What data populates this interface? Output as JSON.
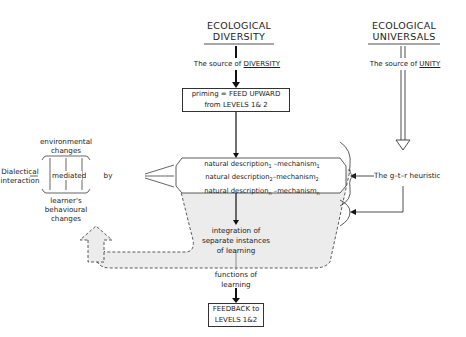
{
  "title_left": {
    "line1": "ECOLOGICAL",
    "line2": "DIVERSITY"
  },
  "title_right": {
    "line1": "ECOLOGICAL",
    "line2": "UNIVERSALS"
  },
  "source_diversity": {
    "prefix": "The source of ",
    "emph": "DIVERSITY"
  },
  "source_unity": {
    "prefix": "The source of ",
    "emph": "UNITY"
  },
  "priming_box": {
    "line1": "priming = FEED UPWARD",
    "line2": "from LEVELS 1& 2"
  },
  "descriptions": [
    {
      "text": "natural description",
      "sub1": "1",
      "mid": " –mechanism",
      "sub2": "1"
    },
    {
      "text": "natural description",
      "sub1": "2",
      "mid": "–mechanism",
      "sub2": "2"
    },
    {
      "text": "natural description",
      "sub1": "n",
      "mid": " –mechanism",
      "sub2": "n"
    }
  ],
  "dialectical": {
    "line1": "Dialectical",
    "line2": "interaction"
  },
  "env_changes": {
    "line1": "environmental",
    "line2": "changes"
  },
  "mediated": "mediated",
  "by": "by",
  "learner_changes": {
    "line1": "learner's",
    "line2": "behavioural",
    "line3": "changes"
  },
  "gtr": "The g–t–r heuristic",
  "integration": {
    "line1": "integration of",
    "line2": "separate instances",
    "line3": "of learning"
  },
  "functions": {
    "line1": "functions of",
    "line2": "learning"
  },
  "feedback_box": {
    "line1": "FEEDBACK to",
    "line2": "LEVELS 1&2"
  },
  "colors": {
    "shaded_region": "#ececec",
    "line": "#222222"
  }
}
